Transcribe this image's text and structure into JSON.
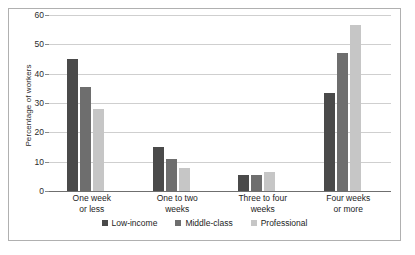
{
  "chart_data": {
    "type": "bar",
    "title": "",
    "xlabel": "",
    "ylabel": "Percentage of workers",
    "ylim": [
      0,
      60
    ],
    "yticks": [
      0,
      10,
      20,
      30,
      40,
      50,
      60
    ],
    "ytick_labels": [
      "0",
      "10",
      "20",
      "30",
      "40",
      "50",
      "60"
    ],
    "grid": true,
    "legend_position": "bottom",
    "categories": [
      "One week\nor less",
      "One to two\nweeks",
      "Three to four\nweeks",
      "Four weeks\nor more"
    ],
    "category_lines": [
      [
        "One week",
        "or less"
      ],
      [
        "One to two",
        "weeks"
      ],
      [
        "Three to four",
        "weeks"
      ],
      [
        "Four weeks",
        "or more"
      ]
    ],
    "series": [
      {
        "name": "Low-income",
        "color": "#4a4a4a",
        "values": [
          45,
          15,
          5.5,
          33.5
        ]
      },
      {
        "name": "Middle-class",
        "color": "#6e6e6e",
        "values": [
          35.5,
          11,
          5.5,
          47
        ]
      },
      {
        "name": "Professional",
        "color": "#c6c6c6",
        "values": [
          28,
          8,
          6.5,
          56.5
        ]
      }
    ]
  },
  "axis": {
    "ylabel": "Percentage of workers"
  },
  "colors": {
    "low_income": "#4a4a4a",
    "middle_class": "#6e6e6e",
    "professional": "#c6c6c6",
    "gridline": "#cfcfcf",
    "axis": "#6f6f6f",
    "border": "#b0b0b0",
    "background": "#ffffff"
  }
}
